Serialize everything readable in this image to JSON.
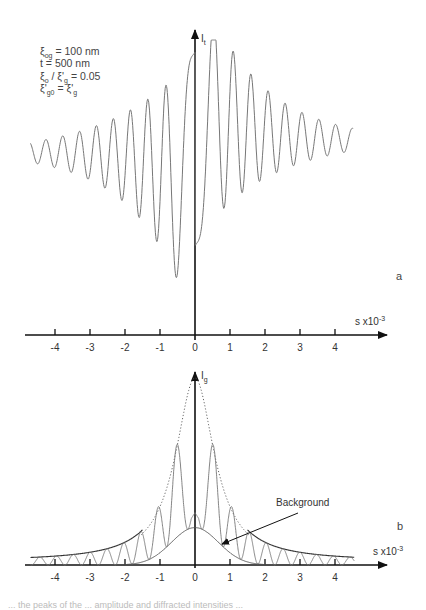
{
  "figure": {
    "parameters": [
      {
        "sym": "ξ",
        "sub": "og",
        "rest": " = 100 nm"
      },
      {
        "sym": "t",
        "sub": "",
        "rest": " = 500 nm"
      },
      {
        "sym": "ξ",
        "sub": "o",
        "rest": " / ξ'",
        "sub2": "g",
        "rest2": " = 0.05"
      },
      {
        "sym": "ξ'",
        "sub": "g0",
        "rest": " = ξ'",
        "sub2": "g",
        "rest2": ""
      }
    ],
    "caption_fragment": "... the peaks of the ... amplitude and diffracted intensities ..."
  },
  "chart_data": [
    {
      "type": "line",
      "panel": "a",
      "title": "",
      "ylabel": "I",
      "ylabel_sub": "t",
      "xlabel": "s x10",
      "xlabel_sup": "-3",
      "x_ticks": [
        "-4",
        "-3",
        "-2",
        "-1",
        "0",
        "1",
        "2",
        "3",
        "4"
      ],
      "xlim": [
        -4.8,
        5.3
      ],
      "ylim": [
        0,
        1.0
      ],
      "grid": false,
      "series": [
        {
          "name": "transmitted intensity I_t (rocking curve)",
          "style": "thin grey solid",
          "x_range": [
            -4.7,
            4.5
          ],
          "description": "asymmetric oscillating curve: low damped oscillations on negative s side descending toward a minimum near s=-0.65, rising steeply through s=0 to a large oscillation peak near s=0.9, then damped oscillations decaying toward s=4.5",
          "key_points": [
            {
              "x": -4.7,
              "y": 0.62
            },
            {
              "x": -0.65,
              "y": 0.0
            },
            {
              "x": 0.3,
              "y": 0.91
            },
            {
              "x": 0.9,
              "y": 1.0
            },
            {
              "x": 4.5,
              "y": 0.63
            }
          ]
        }
      ]
    },
    {
      "type": "line",
      "panel": "b",
      "title": "",
      "ylabel": "I",
      "ylabel_sub": "g",
      "xlabel": "s x10",
      "xlabel_sup": "-3",
      "x_ticks": [
        "-4",
        "-3",
        "-2",
        "-1",
        "0",
        "1",
        "2",
        "3",
        "4"
      ],
      "xlim": [
        -4.8,
        5.3
      ],
      "ylim": [
        0,
        1.0
      ],
      "grid": false,
      "annotations": [
        {
          "text": "Background",
          "points_to": "background curve near s=0.8"
        }
      ],
      "series": [
        {
          "name": "diffracted intensity I_g (oscillating)",
          "style": "thin grey solid",
          "description": "symmetric oscillation between upper and lower envelopes, peaks near s=±0.65 (~0.70), ±1.15 (~0.40), ±1.6 (~0.25)... zero-crossings repeatedly touching the background/baseline; small central peak at s=0 (~0.28)"
        },
        {
          "name": "upper envelope",
          "style": "dotted near center, solid in tails",
          "key_points": [
            {
              "x": 0,
              "y": 1.0
            },
            {
              "x": 0.65,
              "y": 0.7
            },
            {
              "x": 1.15,
              "y": 0.4
            },
            {
              "x": 2.0,
              "y": 0.18
            },
            {
              "x": 4.7,
              "y": 0.05
            }
          ]
        },
        {
          "name": "Background",
          "style": "thin solid",
          "key_points": [
            {
              "x": 0,
              "y": 0.2
            },
            {
              "x": 1.0,
              "y": 0.08
            },
            {
              "x": 2.0,
              "y": 0.0
            }
          ]
        }
      ]
    }
  ]
}
